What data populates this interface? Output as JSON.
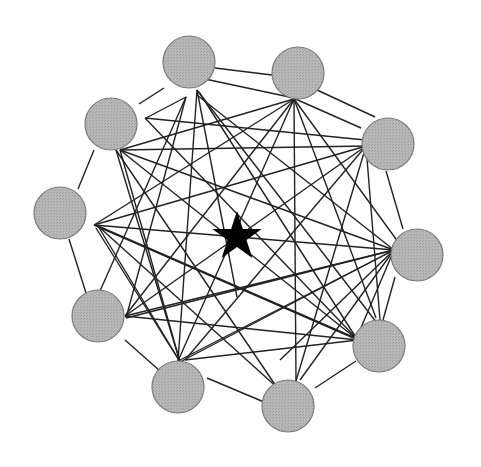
{
  "diagram": {
    "type": "network",
    "node_fill": "#b4b4b4",
    "node_stroke": "#7a7a7a",
    "edge_color": "#222222",
    "star_color": "#000000",
    "node_radius": 26,
    "nodes": [
      {
        "id": "A",
        "x": 189,
        "y": 62
      },
      {
        "id": "B",
        "x": 298,
        "y": 73
      },
      {
        "id": "C",
        "x": 388,
        "y": 144
      },
      {
        "id": "D",
        "x": 417,
        "y": 255
      },
      {
        "id": "E",
        "x": 379,
        "y": 346
      },
      {
        "id": "F",
        "x": 288,
        "y": 406
      },
      {
        "id": "G",
        "x": 178,
        "y": 387
      },
      {
        "id": "H",
        "x": 98,
        "y": 316
      },
      {
        "id": "I",
        "x": 60,
        "y": 213
      },
      {
        "id": "J",
        "x": 111,
        "y": 124
      }
    ],
    "edges": [
      [
        139,
        104,
        164,
        88
      ],
      [
        146,
        118,
        186,
        97
      ],
      [
        215,
        68,
        272,
        75
      ],
      [
        205,
        79,
        294,
        98
      ],
      [
        291,
        97,
        361,
        128
      ],
      [
        315,
        89,
        375,
        117
      ],
      [
        386,
        171,
        403,
        229
      ],
      [
        395,
        277,
        383,
        320
      ],
      [
        356,
        361,
        315,
        388
      ],
      [
        264,
        402,
        207,
        378
      ],
      [
        160,
        371,
        125,
        340
      ],
      [
        86,
        293,
        69,
        239
      ],
      [
        78,
        189,
        94,
        150
      ],
      [
        197,
        90,
        237,
        297
      ],
      [
        197,
        90,
        178,
        361
      ],
      [
        199,
        92,
        355,
        336
      ],
      [
        197,
        90,
        387,
        336
      ],
      [
        294,
        99,
        296,
        381
      ],
      [
        294,
        99,
        178,
        361
      ],
      [
        294,
        99,
        125,
        316
      ],
      [
        294,
        99,
        94,
        225
      ],
      [
        294,
        99,
        404,
        250
      ],
      [
        294,
        99,
        120,
        150
      ],
      [
        294,
        99,
        376,
        318
      ],
      [
        366,
        146,
        120,
        150
      ],
      [
        366,
        146,
        94,
        225
      ],
      [
        366,
        146,
        125,
        316
      ],
      [
        366,
        146,
        185,
        360
      ],
      [
        366,
        146,
        296,
        381
      ],
      [
        365,
        140,
        145,
        118
      ],
      [
        366,
        146,
        380,
        320
      ],
      [
        394,
        250,
        94,
        225
      ],
      [
        394,
        250,
        120,
        150
      ],
      [
        394,
        250,
        180,
        360
      ],
      [
        394,
        250,
        125,
        316
      ],
      [
        394,
        250,
        197,
        95
      ],
      [
        394,
        250,
        280,
        360
      ],
      [
        394,
        250,
        360,
        330
      ],
      [
        358,
        340,
        120,
        150
      ],
      [
        358,
        340,
        94,
        225
      ],
      [
        358,
        340,
        125,
        316
      ],
      [
        358,
        340,
        185,
        360
      ],
      [
        358,
        340,
        145,
        118
      ],
      [
        180,
        362,
        120,
        150
      ],
      [
        180,
        362,
        96,
        228
      ],
      [
        180,
        362,
        394,
        250
      ],
      [
        126,
        318,
        186,
        97
      ],
      [
        126,
        318,
        394,
        250
      ],
      [
        98,
        226,
        360,
        340
      ],
      [
        98,
        226,
        185,
        370
      ],
      [
        98,
        226,
        280,
        390
      ],
      [
        116,
        150,
        180,
        362
      ],
      [
        116,
        150,
        280,
        392
      ],
      [
        96,
        300,
        186,
        97
      ],
      [
        300,
        380,
        394,
        250
      ]
    ],
    "star": {
      "x": 237,
      "y": 237,
      "outer_r": 26,
      "inner_r": 10
    }
  }
}
